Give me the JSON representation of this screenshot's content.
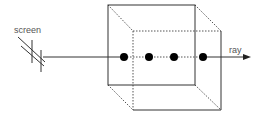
{
  "diagram": {
    "labels": {
      "screen": "screen",
      "ray": "ray"
    },
    "sample_points": 4,
    "colors": {
      "line": "#333333",
      "dotted": "#555555",
      "sample": "#000000",
      "text": "#555555"
    }
  }
}
